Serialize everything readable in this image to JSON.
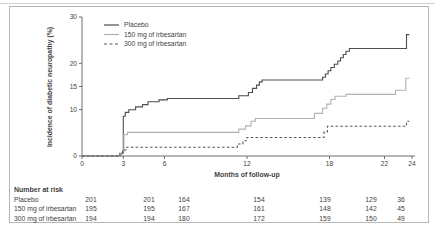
{
  "figure": {
    "border_color": "#b7b7b7",
    "top_rule_color": "#d2d2d2",
    "axis_color": "#6e6e6e",
    "text_color": "#3f3f3f"
  },
  "chart_data": {
    "type": "line",
    "subtype": "kaplan-meier-step",
    "title": "",
    "xlabel": "Months of follow-up",
    "ylabel": "Incidence of diabetic neuropathy (%)",
    "xlim": [
      0,
      24
    ],
    "ylim": [
      0,
      30
    ],
    "xticks": [
      0,
      3,
      6,
      12,
      18,
      22,
      24
    ],
    "yticks": [
      0,
      10,
      15,
      20,
      30
    ],
    "grid": false,
    "legend_position": "top-left-inside",
    "series": [
      {
        "name": "Placebo",
        "line": "solid",
        "color": "#4d4d4d",
        "points": [
          [
            0,
            0
          ],
          [
            2.85,
            0
          ],
          [
            2.85,
            0.6
          ],
          [
            3,
            0.6
          ],
          [
            3,
            8.6
          ],
          [
            3.15,
            8.6
          ],
          [
            3.15,
            9.4
          ],
          [
            3.4,
            9.4
          ],
          [
            3.4,
            10
          ],
          [
            3.9,
            10
          ],
          [
            3.9,
            10.6
          ],
          [
            4.4,
            10.6
          ],
          [
            4.4,
            11.1
          ],
          [
            4.8,
            11.1
          ],
          [
            4.8,
            11.7
          ],
          [
            5.6,
            11.7
          ],
          [
            5.6,
            12.1
          ],
          [
            6.2,
            12.1
          ],
          [
            6.2,
            12.4
          ],
          [
            11.4,
            12.4
          ],
          [
            11.4,
            13
          ],
          [
            12.1,
            13
          ],
          [
            12.1,
            13.7
          ],
          [
            12.4,
            13.7
          ],
          [
            12.4,
            14.6
          ],
          [
            12.7,
            14.6
          ],
          [
            12.7,
            15.3
          ],
          [
            12.9,
            15.3
          ],
          [
            12.9,
            16
          ],
          [
            13.1,
            16
          ],
          [
            13.1,
            16.4
          ],
          [
            17.5,
            16.4
          ],
          [
            17.5,
            17
          ],
          [
            17.7,
            17
          ],
          [
            17.7,
            17.7
          ],
          [
            17.9,
            17.7
          ],
          [
            17.9,
            18.4
          ],
          [
            18.1,
            18.4
          ],
          [
            18.1,
            19.1
          ],
          [
            18.35,
            19.1
          ],
          [
            18.35,
            19.8
          ],
          [
            18.6,
            19.8
          ],
          [
            18.6,
            20.5
          ],
          [
            18.8,
            20.5
          ],
          [
            18.8,
            21.2
          ],
          [
            19,
            21.2
          ],
          [
            19,
            21.9
          ],
          [
            19.2,
            21.9
          ],
          [
            19.2,
            22.6
          ],
          [
            19.45,
            22.6
          ],
          [
            19.45,
            23.2
          ],
          [
            23.6,
            23.2
          ],
          [
            23.6,
            26.2
          ],
          [
            23.8,
            26.2
          ]
        ]
      },
      {
        "name": "150 mg of irbesartan",
        "line": "solid",
        "color": "#b2b2b2",
        "points": [
          [
            0,
            0
          ],
          [
            2.9,
            0
          ],
          [
            2.9,
            0.8
          ],
          [
            3.05,
            0.8
          ],
          [
            3.05,
            4.6
          ],
          [
            3.3,
            4.6
          ],
          [
            3.3,
            5.1
          ],
          [
            11.4,
            5.1
          ],
          [
            11.4,
            5.8
          ],
          [
            11.9,
            5.8
          ],
          [
            11.9,
            6.5
          ],
          [
            12.3,
            6.5
          ],
          [
            12.3,
            7.5
          ],
          [
            12.6,
            7.5
          ],
          [
            12.6,
            8.1
          ],
          [
            16.9,
            8.1
          ],
          [
            16.9,
            9.2
          ],
          [
            17.5,
            9.2
          ],
          [
            17.5,
            10.3
          ],
          [
            17.8,
            10.3
          ],
          [
            17.8,
            11.2
          ],
          [
            18.1,
            11.2
          ],
          [
            18.1,
            12.2
          ],
          [
            18.4,
            12.2
          ],
          [
            18.4,
            12.9
          ],
          [
            19.2,
            12.9
          ],
          [
            19.2,
            13.3
          ],
          [
            22.8,
            13.3
          ],
          [
            22.8,
            14.2
          ],
          [
            23.55,
            14.2
          ],
          [
            23.55,
            16.8
          ],
          [
            23.8,
            16.8
          ]
        ]
      },
      {
        "name": "300 mg of irbesartan",
        "line": "dashed",
        "color": "#555555",
        "points": [
          [
            0,
            0
          ],
          [
            2.75,
            0
          ],
          [
            2.75,
            0.7
          ],
          [
            2.95,
            0.7
          ],
          [
            2.95,
            1.3
          ],
          [
            3.2,
            1.3
          ],
          [
            3.2,
            1.9
          ],
          [
            11.3,
            1.9
          ],
          [
            11.3,
            2.6
          ],
          [
            11.7,
            2.6
          ],
          [
            11.7,
            3.3
          ],
          [
            12,
            3.3
          ],
          [
            12,
            4
          ],
          [
            17.6,
            4
          ],
          [
            17.6,
            5.2
          ],
          [
            17.85,
            5.2
          ],
          [
            17.85,
            6.4
          ],
          [
            23.6,
            6.4
          ],
          [
            23.6,
            7.5
          ],
          [
            23.8,
            7.5
          ]
        ]
      }
    ]
  },
  "risk_table": {
    "title": "Number at risk",
    "columns_months": [
      0,
      3,
      6,
      12,
      18,
      22,
      24
    ],
    "rows": [
      {
        "label": "Placebo",
        "values": [
          201,
          201,
          164,
          154,
          139,
          129,
          36
        ]
      },
      {
        "label": "150 mg of irbesartan",
        "values": [
          195,
          195,
          167,
          161,
          148,
          142,
          45
        ]
      },
      {
        "label": "300 mg of irbesartan",
        "values": [
          194,
          194,
          180,
          172,
          159,
          150,
          49
        ]
      }
    ]
  }
}
